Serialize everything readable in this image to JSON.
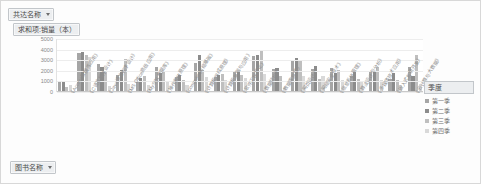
{
  "window": {
    "title": "数据透视图"
  },
  "fields": {
    "series_field": {
      "label": "共达名称",
      "icon": "chevron-down-icon"
    },
    "value_field": {
      "label": "求和项:销量（本）"
    },
    "category_field": {
      "label": "图书名称",
      "icon": "chevron-down-icon"
    }
  },
  "legend": {
    "field_label": "季度",
    "icon": "chevron-down-icon",
    "items": [
      {
        "label": "第一季",
        "color": "#a6a6a6"
      },
      {
        "label": "第二季",
        "color": "#8c8c8c"
      },
      {
        "label": "第三季",
        "color": "#bfbfbf"
      },
      {
        "label": "第四季",
        "color": "#d9d9d9"
      }
    ]
  },
  "chart_data": {
    "type": "bar",
    "title": "求和项:销量（本）",
    "xlabel": "图书名称",
    "ylabel": "求和项:销量（本）",
    "ylim": [
      0,
      5000
    ],
    "yticks": [
      5000,
      4000,
      3000,
      2000,
      1000,
      0
    ],
    "ytick_labels": [
      "5000",
      "4000",
      "3000",
      "2000",
      "1000",
      "0"
    ],
    "grid": true,
    "legend_position": "right",
    "categories": [
      "《Access数据库应用》",
      "《C语言程序设计》",
      "《Java语言程序设计》",
      "《MS Office高级应用》",
      "《MySQL数据库》",
      "《操作系统原理》",
      "《computer网络基础》",
      "《计算机组成原理》",
      "《计算机基础与应用》",
      "《软件工程导论》",
      "《数据结构》",
      "《数据库原理》",
      "《网页设计》",
      "《网络安全技术》",
      "《信息系统管理》",
      "《算法设计与分析》",
      "《多媒体技术应用》",
      "《嵌入式系统开发》",
      "《云计算与大数据》"
    ],
    "series": [
      {
        "name": "第一季",
        "color": "#a6a6a6",
        "values": [
          1050,
          3650,
          2600,
          1600,
          900,
          2400,
          1400,
          2750,
          1450,
          1950,
          3400,
          2150,
          2900,
          2200,
          2250,
          1550,
          1900,
          1200,
          2400
        ]
      },
      {
        "name": "第二季",
        "color": "#8c8c8c",
        "values": [
          950,
          3800,
          2350,
          2050,
          1350,
          1750,
          1650,
          3500,
          1600,
          2000,
          3500,
          2250,
          3250,
          2500,
          1800,
          1900,
          2000,
          1750,
          1500
        ]
      },
      {
        "name": "第三季",
        "color": "#bfbfbf",
        "values": [
          450,
          3500,
          1850,
          3150,
          1550,
          1950,
          1150,
          2050,
          1700,
          1650,
          3900,
          1550,
          3000,
          1250,
          2050,
          1250,
          2400,
          1100,
          3500
        ]
      },
      {
        "name": "第四季",
        "color": "#d9d9d9",
        "values": [
          700,
          3300,
          600,
          800,
          700,
          950,
          700,
          1400,
          1100,
          1300,
          1700,
          350,
          1500,
          1500,
          1100,
          1000,
          1150,
          700,
          800
        ]
      }
    ]
  }
}
